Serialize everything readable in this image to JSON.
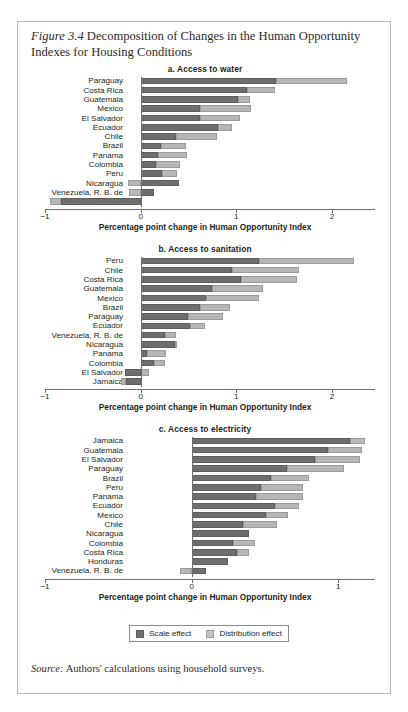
{
  "figure": {
    "label": "Figure 3.4",
    "title": "Decomposition of Changes in the Human Opportunity Indexes for Housing Conditions",
    "source_lead": "Source:",
    "source_text": "Authors' calculations using household surveys."
  },
  "legend": {
    "items": [
      {
        "key": "scale",
        "label": "Scale effect",
        "color": "#6e6e6e"
      },
      {
        "key": "distribution",
        "label": "Distribution effect",
        "color": "#c3c3c3"
      }
    ]
  },
  "axis_title": "Percentage point change in Human Opportunity Index",
  "chart_data": [
    {
      "type": "bar",
      "orientation": "horizontal",
      "stacked": true,
      "title": "a. Access to water",
      "xlabel": "Percentage point change in Human Opportunity Index",
      "ylabel": "",
      "xlim": [
        -1,
        2.45
      ],
      "xticks": [
        -1,
        0,
        1,
        2
      ],
      "xticklabels": [
        "−1",
        "0",
        "1",
        "2"
      ],
      "grid": false,
      "legend_position": "bottom",
      "categories": [
        "Paraguay",
        "Costa Rica",
        "Guatemala",
        "Mexico",
        "El Salvador",
        "Ecuador",
        "Chile",
        "Brazil",
        "Panama",
        "Colombia",
        "Peru",
        "Nicaragua",
        "Venezuela, R. B. de",
        "Jamaica"
      ],
      "series": [
        {
          "name": "Scale effect",
          "values": [
            1.42,
            1.11,
            1.02,
            0.62,
            0.62,
            0.81,
            0.37,
            0.21,
            0.18,
            0.16,
            0.22,
            0.4,
            0.14,
            -0.83
          ]
        },
        {
          "name": "Distribution effect",
          "values": [
            0.74,
            0.29,
            0.12,
            0.53,
            0.42,
            0.15,
            0.43,
            0.26,
            0.3,
            0.25,
            0.16,
            -0.13,
            -0.12,
            -0.12
          ]
        }
      ],
      "totals": [
        2.16,
        1.4,
        1.14,
        1.15,
        1.04,
        0.96,
        0.8,
        0.47,
        0.48,
        0.41,
        0.38,
        0.27,
        0.02,
        -0.95
      ]
    },
    {
      "type": "bar",
      "orientation": "horizontal",
      "stacked": true,
      "title": "b. Access to sanitation",
      "xlabel": "Percentage point change in Human Opportunity Index",
      "ylabel": "",
      "xlim": [
        -1,
        2.45
      ],
      "xticks": [
        -1,
        0,
        1,
        2
      ],
      "xticklabels": [
        "−1",
        "0",
        "1",
        "2"
      ],
      "grid": false,
      "legend_position": "bottom",
      "categories": [
        "Peru",
        "Chile",
        "Costa Rica",
        "Guatemala",
        "Mexico",
        "Brazil",
        "Paraguay",
        "Ecuador",
        "Venezuela, R. B. de",
        "Nicaragua",
        "Panama",
        "Colombia",
        "El Salvador",
        "Jamaica"
      ],
      "series": [
        {
          "name": "Scale effect",
          "values": [
            1.24,
            0.96,
            1.05,
            0.75,
            0.68,
            0.62,
            0.5,
            0.52,
            0.25,
            0.36,
            0.07,
            0.14,
            -0.16,
            -0.15
          ]
        },
        {
          "name": "Distribution effect",
          "values": [
            0.99,
            0.7,
            0.58,
            0.53,
            0.56,
            0.31,
            0.36,
            0.15,
            0.12,
            0.02,
            0.2,
            0.11,
            0.09,
            -0.06
          ]
        }
      ],
      "totals": [
        2.23,
        1.66,
        1.63,
        1.28,
        1.24,
        0.93,
        0.86,
        0.67,
        0.37,
        0.38,
        0.27,
        0.25,
        -0.07,
        -0.21
      ]
    },
    {
      "type": "bar",
      "orientation": "horizontal",
      "stacked": true,
      "title": "c. Access to electricity",
      "xlabel": "Percentage point change in Human Opportunity Index",
      "ylabel": "",
      "xlim": [
        -1,
        1.25
      ],
      "xticks": [
        -1,
        0,
        1
      ],
      "xticklabels": [
        "−1",
        "0",
        "1"
      ],
      "grid": false,
      "legend_position": "bottom",
      "categories": [
        "Jamaica",
        "Guatemala",
        "El Salvador",
        "Paraguay",
        "Brazil",
        "Peru",
        "Panama",
        "Ecuador",
        "Mexico",
        "Chile",
        "Nicaragua",
        "Colombia",
        "Costa Rica",
        "Honduras",
        "Venezuela, R. B. de"
      ],
      "series": [
        {
          "name": "Scale effect",
          "values": [
            1.08,
            0.93,
            0.84,
            0.65,
            0.54,
            0.47,
            0.44,
            0.57,
            0.51,
            0.35,
            0.39,
            0.28,
            0.31,
            0.25,
            0.1
          ]
        },
        {
          "name": "Distribution effect",
          "values": [
            0.1,
            0.23,
            0.31,
            0.39,
            0.26,
            0.29,
            0.32,
            0.16,
            0.15,
            0.23,
            0.0,
            0.15,
            0.08,
            0.0,
            -0.08
          ]
        }
      ],
      "totals": [
        1.18,
        1.16,
        1.15,
        1.04,
        0.8,
        0.76,
        0.76,
        0.73,
        0.66,
        0.58,
        0.39,
        0.43,
        0.39,
        0.25,
        0.1
      ]
    }
  ]
}
